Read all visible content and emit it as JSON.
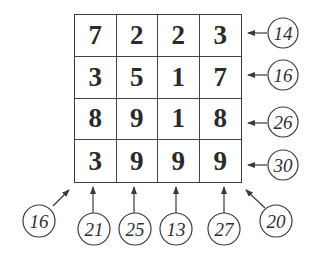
{
  "grid": {
    "rows": [
      [
        7,
        2,
        2,
        3
      ],
      [
        3,
        5,
        1,
        7
      ],
      [
        8,
        9,
        1,
        8
      ],
      [
        3,
        9,
        9,
        9
      ]
    ]
  },
  "row_sums": [
    "14",
    "16",
    "26",
    "30"
  ],
  "column_sums": [
    "21",
    "25",
    "13",
    "27"
  ],
  "diagonal_sums": {
    "anti_diagonal_bottom_left": "16",
    "main_diagonal_bottom_right": "20"
  },
  "colors": {
    "line": "#3a3a3a",
    "text": "#2a2a2a",
    "background": "#ffffff"
  }
}
